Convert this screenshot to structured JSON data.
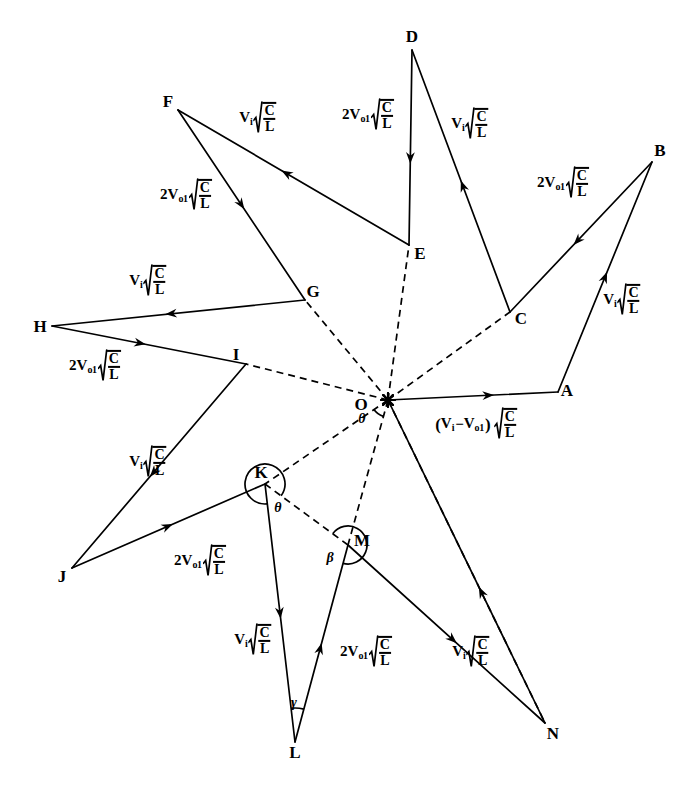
{
  "figure": {
    "type": "vector-star-diagram",
    "background_color": "#ffffff",
    "line_color": "#000000"
  },
  "center": {
    "label": "O",
    "x": 388,
    "y": 400,
    "angle_label": "θ"
  },
  "vertices": [
    {
      "label": "A",
      "x": 558,
      "y": 392,
      "lx": 567,
      "ly": 390
    },
    {
      "label": "B",
      "x": 652,
      "y": 162,
      "lx": 660,
      "ly": 150
    },
    {
      "label": "C",
      "x": 510,
      "y": 312,
      "lx": 521,
      "ly": 318
    },
    {
      "label": "D",
      "x": 412,
      "y": 50,
      "lx": 412,
      "ly": 36
    },
    {
      "label": "E",
      "x": 409,
      "y": 245,
      "lx": 420,
      "ly": 253
    },
    {
      "label": "F",
      "x": 178,
      "y": 110,
      "lx": 168,
      "ly": 101
    },
    {
      "label": "G",
      "x": 305,
      "y": 300,
      "lx": 313,
      "ly": 291
    },
    {
      "label": "H",
      "x": 52,
      "y": 326,
      "lx": 40,
      "ly": 326
    },
    {
      "label": "I",
      "x": 246,
      "y": 364,
      "lx": 236,
      "ly": 354
    },
    {
      "label": "J",
      "x": 72,
      "y": 568,
      "lx": 62,
      "ly": 576
    },
    {
      "label": "K",
      "x": 265,
      "y": 484,
      "lx": 261,
      "ly": 472
    },
    {
      "label": "L",
      "x": 295,
      "y": 742,
      "lx": 295,
      "ly": 752
    },
    {
      "label": "M",
      "x": 348,
      "y": 545,
      "lx": 362,
      "ly": 540
    },
    {
      "label": "N",
      "x": 545,
      "y": 723,
      "lx": 553,
      "ly": 733
    }
  ],
  "angles": [
    {
      "name": "theta-at-center",
      "label": "θ",
      "x": 362,
      "y": 419
    },
    {
      "name": "theta-at-K",
      "label": "θ",
      "x": 278,
      "y": 508
    },
    {
      "name": "beta-at-M",
      "label": "β",
      "x": 330,
      "y": 558
    },
    {
      "name": "gamma-at-L",
      "label": "γ",
      "x": 294,
      "y": 703
    }
  ],
  "expressions": {
    "v_i": {
      "coef": "V",
      "sub": "i",
      "radicand_num": "C",
      "radicand_den": "L"
    },
    "two_v_o1": {
      "coef": "2V",
      "sub": "o1",
      "radicand_num": "C",
      "radicand_den": "L"
    },
    "difference": {
      "open": "(",
      "first": "V",
      "first_sub": "i",
      "minus": "−",
      "second": "V",
      "second_sub": "o1",
      "close": ")",
      "radicand_num": "C",
      "radicand_den": "L"
    }
  },
  "labels": [
    {
      "id": "lbl-fe",
      "kind": "v_i",
      "x": 258,
      "y": 118,
      "edge": "E→F"
    },
    {
      "id": "lbl-de",
      "kind": "two_v_o1",
      "x": 368,
      "y": 115,
      "edge": "D→E"
    },
    {
      "id": "lbl-cd",
      "kind": "v_i",
      "x": 470,
      "y": 124,
      "edge": "C→D"
    },
    {
      "id": "lbl-bc",
      "kind": "two_v_o1",
      "x": 563,
      "y": 183,
      "edge": "B→C"
    },
    {
      "id": "lbl-ab",
      "kind": "v_i",
      "x": 622,
      "y": 300,
      "edge": "A→B"
    },
    {
      "id": "lbl-fg",
      "kind": "two_v_o1",
      "x": 186,
      "y": 195,
      "edge": "F→G"
    },
    {
      "id": "lbl-gh",
      "kind": "v_i",
      "x": 148,
      "y": 281,
      "edge": "G→H"
    },
    {
      "id": "lbl-hi",
      "kind": "two_v_o1",
      "x": 95,
      "y": 366,
      "edge": "H→I"
    },
    {
      "id": "lbl-ij",
      "kind": "v_i",
      "x": 148,
      "y": 462,
      "edge": "I→J"
    },
    {
      "id": "lbl-jk",
      "kind": "two_v_o1",
      "x": 200,
      "y": 561,
      "edge": "J→K"
    },
    {
      "id": "lbl-kl",
      "kind": "v_i",
      "x": 253,
      "y": 640,
      "edge": "K→L"
    },
    {
      "id": "lbl-lm",
      "kind": "two_v_o1",
      "x": 366,
      "y": 652,
      "edge": "L→M"
    },
    {
      "id": "lbl-mn",
      "kind": "v_i",
      "x": 471,
      "y": 652,
      "edge": "M→N"
    },
    {
      "id": "lbl-oa",
      "kind": "difference",
      "x": 476,
      "y": 424,
      "edge": "O→A"
    }
  ],
  "solid_edges": [
    {
      "from": "E",
      "to": "F",
      "arrow_at": 0.55
    },
    {
      "from": "F",
      "to": "G",
      "arrow_at": 0.52
    },
    {
      "from": "G",
      "to": "H",
      "arrow_at": 0.55
    },
    {
      "from": "H",
      "to": "I",
      "arrow_at": 0.48
    },
    {
      "from": "I",
      "to": "J",
      "arrow_at": 0.55
    },
    {
      "from": "J",
      "to": "K",
      "arrow_at": 0.52
    },
    {
      "from": "K",
      "to": "L",
      "arrow_at": 0.52
    },
    {
      "from": "L",
      "to": "M",
      "arrow_at": 0.5
    },
    {
      "from": "M",
      "to": "N",
      "arrow_at": 0.55
    },
    {
      "from": "N",
      "to": "O",
      "arrow_at": 0.42
    },
    {
      "from": "O",
      "to": "A",
      "arrow_at": 0.62
    },
    {
      "from": "A",
      "to": "B",
      "arrow_at": 0.52
    },
    {
      "from": "B",
      "to": "C",
      "arrow_at": 0.55
    },
    {
      "from": "C",
      "to": "D",
      "arrow_at": 0.5
    },
    {
      "from": "D",
      "to": "E",
      "arrow_at": 0.58
    }
  ],
  "dashed_edges": [
    {
      "from": "O",
      "to": "C"
    },
    {
      "from": "O",
      "to": "E"
    },
    {
      "from": "O",
      "to": "G"
    },
    {
      "from": "O",
      "to": "I"
    },
    {
      "from": "O",
      "to": "K"
    },
    {
      "from": "O",
      "to": "M"
    },
    {
      "from": "O",
      "to": "N"
    },
    {
      "from": "K",
      "to": "M"
    }
  ]
}
